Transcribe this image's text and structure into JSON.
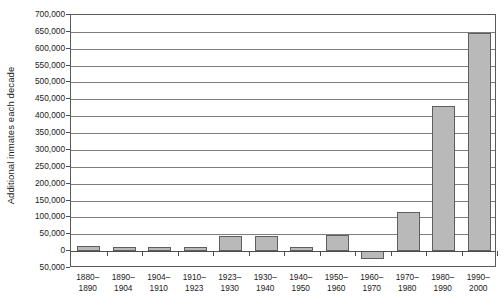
{
  "chart_data": {
    "type": "bar",
    "title": "",
    "xlabel": "",
    "ylabel": "Additional inmates each decade",
    "categories": [
      "1880–1890",
      "1890–1904",
      "1904–1910",
      "1910–1923",
      "1923–1930",
      "1930–1940",
      "1940–1950",
      "1950–1960",
      "1960–1970",
      "1970–1980",
      "1980–1990",
      "1990–2000"
    ],
    "category_lines": [
      [
        "1880–",
        "1890"
      ],
      [
        "1890–",
        "1904"
      ],
      [
        "1904–",
        "1910"
      ],
      [
        "1910–",
        "1923"
      ],
      [
        "1923–",
        "1930"
      ],
      [
        "1930–",
        "1940"
      ],
      [
        "1940–",
        "1950"
      ],
      [
        "1950–",
        "1960"
      ],
      [
        "1960–",
        "1970"
      ],
      [
        "1970–",
        "1980"
      ],
      [
        "1980–",
        "1990"
      ],
      [
        "1990–",
        "2000"
      ]
    ],
    "values": [
      14000,
      12000,
      11000,
      12000,
      44000,
      46000,
      13000,
      47000,
      -22000,
      115000,
      430000,
      648000
    ],
    "ylim": [
      -50000,
      700000
    ],
    "ytick_step": 50000,
    "ytick_labels": [
      "700,000",
      "650,000",
      "600,000",
      "550,000",
      "500,000",
      "450,000",
      "400,000",
      "350,000",
      "300,000",
      "250,000",
      "200,000",
      "150,000",
      "100,000",
      "50,000",
      "0",
      "50,000"
    ],
    "ytick_values": [
      700000,
      650000,
      600000,
      550000,
      500000,
      450000,
      400000,
      350000,
      300000,
      250000,
      200000,
      150000,
      100000,
      50000,
      0,
      -50000
    ],
    "grid": true,
    "legend": "none",
    "bar_fill": "#b9b9b9",
    "bar_border": "#5e5e5e",
    "axis_color": "#5a5a5a",
    "grid_color": "#7d7d7d"
  }
}
